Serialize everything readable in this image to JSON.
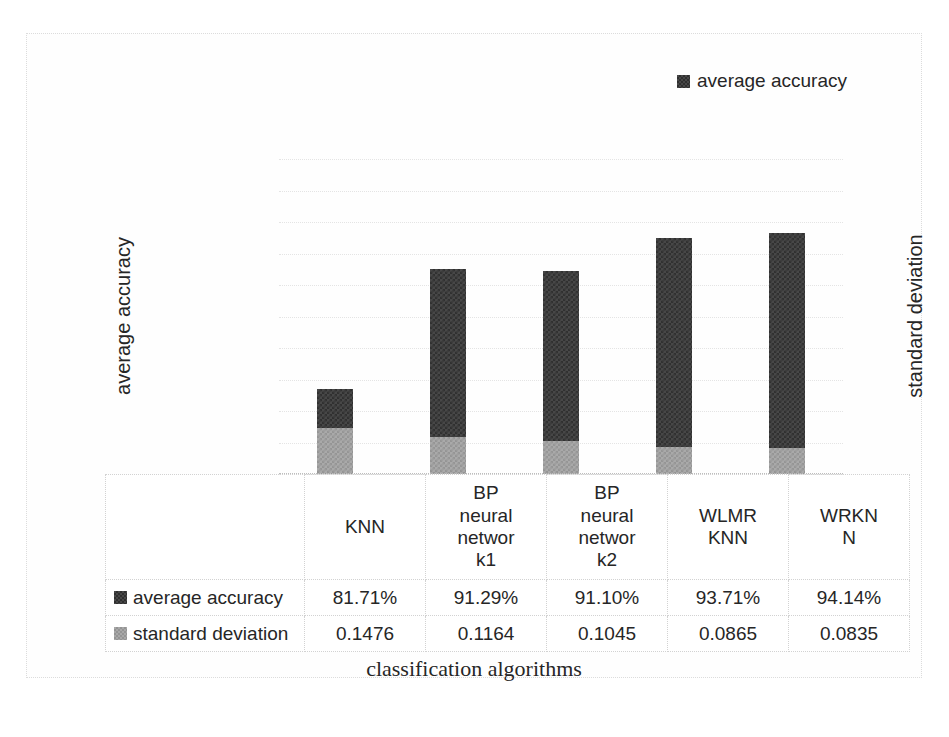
{
  "legend": {
    "items": [
      {
        "label": "average accuracy",
        "color": "#474747"
      }
    ]
  },
  "axes": {
    "left_title": "average accuracy",
    "right_title": "standard deviation",
    "x_title": "classification algorithms",
    "left_ticks": [
      "100.00%",
      "95.00%",
      "90.00%",
      "85.00%",
      "80.00%",
      "75.00%"
    ],
    "right_ticks": [
      "1",
      "0.9",
      "0.8",
      "0.7",
      "0.6",
      "0.5",
      "0.4",
      "0.3",
      "0.2",
      "0.1",
      "0"
    ]
  },
  "table": {
    "row_labels": [
      "average accuracy",
      "standard deviation"
    ],
    "categories": [
      "KNN",
      "BP\nneural\nnetwor\nk1",
      "BP\nneural\nnetwor\nk2",
      "WLMR\nKNN",
      "WRKN\nN"
    ],
    "accuracy_display": [
      "81.71%",
      "91.29%",
      "91.10%",
      "93.71%",
      "94.14%"
    ],
    "stddev_display": [
      "0.1476",
      "0.1164",
      "0.1045",
      "0.0865",
      "0.0835"
    ]
  },
  "chart_data": {
    "type": "bar",
    "subtype": "stacked-column",
    "title": "",
    "xlabel": "classification algorithms",
    "ylabel": "average accuracy",
    "y2label": "standard deviation",
    "categories": [
      "KNN",
      "BP neural network1",
      "BP neural network2",
      "WLMR KNN",
      "WRKNN"
    ],
    "series": [
      {
        "name": "average accuracy",
        "axis": "left",
        "unit": "percent",
        "color": "#474747",
        "values": [
          81.71,
          91.29,
          91.1,
          93.71,
          94.14
        ]
      },
      {
        "name": "standard deviation",
        "axis": "right",
        "unit": "ratio",
        "color": "#a9a9a9",
        "values": [
          0.1476,
          0.1164,
          0.1045,
          0.0865,
          0.0835
        ]
      }
    ],
    "ylim": [
      75,
      100
    ],
    "ytick_step": 5,
    "y2lim": [
      0,
      1
    ],
    "y2tick_step": 0.1,
    "grid": true,
    "minor_grid": true,
    "legend_position": "top-right",
    "data_table": true
  }
}
